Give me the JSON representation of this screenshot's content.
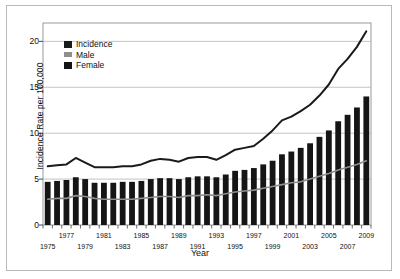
{
  "chart_data": {
    "type": "bar",
    "title": "",
    "xlabel": "Year",
    "ylabel": "Incidence Rate per 100,000",
    "ylim": [
      0,
      22
    ],
    "yticks": [
      0,
      5,
      10,
      15,
      20
    ],
    "grid": true,
    "legend_position": "top-left",
    "categories": [
      1975,
      1976,
      1977,
      1978,
      1979,
      1980,
      1981,
      1982,
      1983,
      1984,
      1985,
      1986,
      1987,
      1988,
      1989,
      1990,
      1991,
      1992,
      1993,
      1994,
      1995,
      1996,
      1997,
      1998,
      1999,
      2000,
      2001,
      2002,
      2003,
      2004,
      2005,
      2006,
      2007,
      2008,
      2009
    ],
    "xtick_labels": [
      "1975",
      "1977",
      "1979",
      "1981",
      "1983",
      "1985",
      "1987",
      "1989",
      "1991",
      "1993",
      "1995",
      "1997",
      "1999",
      "2001",
      "2003",
      "2005",
      "2007",
      "2009"
    ],
    "series": [
      {
        "name": "Incidence",
        "render": "line",
        "color": "#1a1a1a",
        "values": [
          6.4,
          6.5,
          6.6,
          7.3,
          6.8,
          6.3,
          6.3,
          6.3,
          6.4,
          6.4,
          6.6,
          7.0,
          7.2,
          7.1,
          6.9,
          7.3,
          7.4,
          7.4,
          7.1,
          7.6,
          8.2,
          8.4,
          8.6,
          9.4,
          10.3,
          11.4,
          11.8,
          12.4,
          13.1,
          14.1,
          15.3,
          17.0,
          18.1,
          19.4,
          21.1
        ]
      },
      {
        "name": "Male",
        "render": "line",
        "color": "#8e8e8e",
        "values": [
          2.8,
          2.9,
          2.9,
          3.2,
          3.1,
          2.9,
          2.8,
          2.8,
          2.8,
          2.8,
          2.9,
          3.0,
          3.1,
          3.1,
          3.0,
          3.2,
          3.2,
          3.3,
          3.2,
          3.4,
          3.6,
          3.7,
          3.8,
          4.0,
          4.2,
          4.4,
          4.6,
          4.7,
          5.0,
          5.3,
          5.6,
          6.0,
          6.3,
          6.6,
          7.0
        ]
      },
      {
        "name": "Female",
        "render": "bar",
        "color": "#151515",
        "values": [
          4.7,
          4.8,
          4.9,
          5.2,
          5.0,
          4.6,
          4.6,
          4.6,
          4.7,
          4.7,
          4.8,
          5.0,
          5.1,
          5.1,
          5.0,
          5.2,
          5.3,
          5.3,
          5.2,
          5.5,
          5.9,
          6.0,
          6.2,
          6.6,
          7.0,
          7.7,
          8.0,
          8.4,
          8.9,
          9.6,
          10.3,
          11.3,
          12.0,
          12.8,
          14.0
        ]
      }
    ]
  },
  "legend": {
    "items": [
      {
        "label": "Incidence",
        "color": "#1a1a1a"
      },
      {
        "label": "Male",
        "color": "#8e8e8e"
      },
      {
        "label": "Female",
        "color": "#151515"
      }
    ]
  }
}
